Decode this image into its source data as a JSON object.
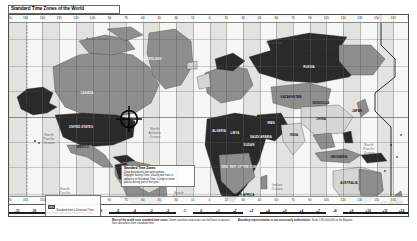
{
  "title": "Standard Time Zones of the World",
  "map": {
    "projection_note": "Mercator-style world map, grayscale",
    "ocean_labels": [
      {
        "name": "arctic-ocean-label",
        "text": "Arctic  Ocean",
        "x": 88,
        "y": 22
      },
      {
        "name": "north-pacific-label",
        "text": "North\nPacific\nOcean",
        "x": 40,
        "y": 118
      },
      {
        "name": "north-atlantic-label",
        "text": "North\nAtlantic\nOcean",
        "x": 146,
        "y": 112
      },
      {
        "name": "south-pacific-label",
        "text": "South\nPacific\nOcean",
        "x": 56,
        "y": 172
      },
      {
        "name": "south-atlantic-label",
        "text": "South\nAtlantic\nOcean",
        "x": 170,
        "y": 176
      },
      {
        "name": "indian-ocean-label",
        "text": "Indian\nOcean",
        "x": 268,
        "y": 168
      },
      {
        "name": "north-pacific-east-label",
        "text": "North\nPacific\nOcean",
        "x": 360,
        "y": 128
      },
      {
        "name": "barents-sea-label",
        "text": "Kara  Sea",
        "x": 265,
        "y": 26
      },
      {
        "name": "southern-ocean-label",
        "text": "Southern  Ocean",
        "x": 210,
        "y": 196
      }
    ],
    "country_labels": [
      {
        "name": "canada-label",
        "text": "CANADA",
        "x": 78,
        "y": 78,
        "light": true
      },
      {
        "name": "united-states-label",
        "text": "UNITED STATES",
        "x": 72,
        "y": 112,
        "light": true
      },
      {
        "name": "greenland-label",
        "text": "GREENLAND",
        "x": 143,
        "y": 44,
        "light": true
      },
      {
        "name": "mexico-label",
        "text": "MEXICO",
        "x": 74,
        "y": 132,
        "light": false
      },
      {
        "name": "brazil-label",
        "text": "BRAZIL",
        "x": 136,
        "y": 156,
        "light": false
      },
      {
        "name": "argentina-label",
        "text": "ARGENTINA",
        "x": 120,
        "y": 183,
        "light": false
      },
      {
        "name": "russia-label",
        "text": "RUSSIA",
        "x": 300,
        "y": 52,
        "light": true
      },
      {
        "name": "china-label",
        "text": "CHINA",
        "x": 312,
        "y": 104,
        "light": false
      },
      {
        "name": "india-label",
        "text": "INDIA",
        "x": 285,
        "y": 120,
        "light": false
      },
      {
        "name": "australia-label",
        "text": "AUSTRALIA",
        "x": 340,
        "y": 168,
        "light": false
      },
      {
        "name": "kazakhstan-label",
        "text": "KAZAKHSTAN",
        "x": 282,
        "y": 82,
        "light": false
      },
      {
        "name": "algeria-label",
        "text": "ALGERIA",
        "x": 210,
        "y": 116,
        "light": true
      },
      {
        "name": "libya-label",
        "text": "LIBYA",
        "x": 226,
        "y": 118,
        "light": true
      },
      {
        "name": "sudan-label",
        "text": "SUDAN",
        "x": 240,
        "y": 130,
        "light": true
      },
      {
        "name": "dem-rep-congo-label",
        "text": "DEM. REP.\nOF THE CONGO",
        "x": 232,
        "y": 152,
        "light": true
      },
      {
        "name": "south-africa-label",
        "text": "SOUTH\nAFRICA",
        "x": 234,
        "y": 180,
        "light": false
      },
      {
        "name": "mongolia-label",
        "text": "MONGOLIA",
        "x": 312,
        "y": 88,
        "light": false
      },
      {
        "name": "iran-label",
        "text": "IRAN",
        "x": 262,
        "y": 108,
        "light": true
      },
      {
        "name": "saudi-arabia-label",
        "text": "SAUDI\nARABIA",
        "x": 252,
        "y": 122,
        "light": true
      },
      {
        "name": "indonesia-label",
        "text": "INDONESIA",
        "x": 330,
        "y": 142,
        "light": false
      },
      {
        "name": "japan-label",
        "text": "JAPAN",
        "x": 348,
        "y": 96,
        "light": false
      },
      {
        "name": "new-zealand-label",
        "text": "NEW\nZEALAND",
        "x": 382,
        "y": 188,
        "light": false
      }
    ],
    "top_ticks": [
      "180",
      "165",
      "150",
      "135",
      "120",
      "105",
      "90",
      "75",
      "60",
      "45",
      "30",
      "15",
      "0",
      "15",
      "30",
      "45",
      "60",
      "75",
      "90",
      "105",
      "120",
      "135",
      "150",
      "165",
      "180"
    ],
    "bottom_offsets": [
      "-11",
      "-10",
      "-9",
      "-8",
      "-7",
      "-6",
      "-5",
      "-4",
      "-3",
      "-2",
      "-1",
      "0",
      "+1",
      "+2",
      "+3",
      "+4",
      "+5",
      "+6",
      "+7",
      "+8",
      "+9",
      "+10",
      "+11",
      "+12"
    ],
    "date_line_label": "International Date Line"
  },
  "legend": {
    "title": "Standard Time Zones",
    "lines": [
      "Zone boundaries are approximate.",
      "Daylight Saving Time, usually one hour in",
      "advance of Standard Time, is kept in some",
      "places during part of the year."
    ],
    "swatch_caption": "Standard time = Universal Time"
  },
  "footnotes": [
    {
      "name": "footnote-left",
      "bold": "Most of the world uses standard time zones.",
      "text": "Some countries and areas use half-hour or quarter-hour deviations from standard time."
    },
    {
      "name": "footnote-right",
      "bold": "Boundary representation is not necessarily authoritative.",
      "text": "Scale 1:85,000,000 at the Equator."
    }
  ],
  "marker": {
    "name": "crosshair-marker",
    "label": "Washington, D.C.",
    "x": 120,
    "y": 104
  },
  "colors": {
    "frame": "#4a4a4a",
    "ocean": "#f6f6f4",
    "band_light": "#ececea",
    "band_mid": "#b9b9b6",
    "band_dark": "#6f6f6d",
    "land_dark": "#2a2a2a",
    "land_mid": "#8e8e8c",
    "land_light": "#d5d5d2",
    "dateline": "#1a1a1a"
  }
}
